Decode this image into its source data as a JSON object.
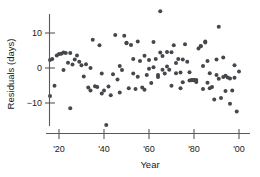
{
  "chart_data": {
    "type": "scatter",
    "title": "",
    "xlabel": "Year",
    "ylabel": "Residuals (days)",
    "xlim": [
      1913,
      2003
    ],
    "ylim": [
      -17,
      17
    ],
    "grid": false,
    "legend": null,
    "x_ticks": [
      {
        "value": 1920,
        "label": "'20"
      },
      {
        "value": 1940,
        "label": "'40"
      },
      {
        "value": 1960,
        "label": "'60"
      },
      {
        "value": 1980,
        "label": "'80"
      },
      {
        "value": 2000,
        "label": "'00"
      }
    ],
    "y_ticks": [
      {
        "value": 10,
        "label": "10"
      },
      {
        "value": 0,
        "label": "0"
      },
      {
        "value": -10,
        "label": "−10"
      }
    ],
    "marker": {
      "shape": "circle",
      "size": 2.0,
      "color": "#44474b"
    },
    "points": [
      {
        "x": 1916,
        "y": 2.3
      },
      {
        "x": 1916,
        "y": -8.0
      },
      {
        "x": 1917,
        "y": 2.6
      },
      {
        "x": 1918,
        "y": -5.1
      },
      {
        "x": 1919,
        "y": 3.6
      },
      {
        "x": 1920,
        "y": 4.0
      },
      {
        "x": 1921,
        "y": 4.1
      },
      {
        "x": 1922,
        "y": 4.4
      },
      {
        "x": 1922,
        "y": -0.6
      },
      {
        "x": 1923,
        "y": 4.3
      },
      {
        "x": 1924,
        "y": 1.5
      },
      {
        "x": 1925,
        "y": 4.3
      },
      {
        "x": 1925,
        "y": -11.5
      },
      {
        "x": 1926,
        "y": 1.0
      },
      {
        "x": 1927,
        "y": 2.4
      },
      {
        "x": 1928,
        "y": 3.6
      },
      {
        "x": 1929,
        "y": 1.8
      },
      {
        "x": 1930,
        "y": 0.8
      },
      {
        "x": 1931,
        "y": -2.4
      },
      {
        "x": 1932,
        "y": 1.1
      },
      {
        "x": 1933,
        "y": -5.6
      },
      {
        "x": 1934,
        "y": -6.4
      },
      {
        "x": 1935,
        "y": 8.1
      },
      {
        "x": 1936,
        "y": -5.2
      },
      {
        "x": 1937,
        "y": -5.4
      },
      {
        "x": 1938,
        "y": 6.5
      },
      {
        "x": 1939,
        "y": -1.6
      },
      {
        "x": 1939,
        "y": -7.3
      },
      {
        "x": 1940,
        "y": -6.4
      },
      {
        "x": 1941,
        "y": -16.3
      },
      {
        "x": 1942,
        "y": -5.3
      },
      {
        "x": 1943,
        "y": -7.8
      },
      {
        "x": 1944,
        "y": -1.8
      },
      {
        "x": 1945,
        "y": 9.4
      },
      {
        "x": 1946,
        "y": -3.3
      },
      {
        "x": 1947,
        "y": 0.6
      },
      {
        "x": 1948,
        "y": -0.6
      },
      {
        "x": 1949,
        "y": 9.2
      },
      {
        "x": 1950,
        "y": 7.2
      },
      {
        "x": 1950,
        "y": 7.1
      },
      {
        "x": 1951,
        "y": -5.8
      },
      {
        "x": 1952,
        "y": 6.6
      },
      {
        "x": 1953,
        "y": -1.6
      },
      {
        "x": 1954,
        "y": -6.0
      },
      {
        "x": 1955,
        "y": 7.6
      },
      {
        "x": 1955,
        "y": -2.5
      },
      {
        "x": 1956,
        "y": 2.0
      },
      {
        "x": 1957,
        "y": -5.6
      },
      {
        "x": 1958,
        "y": -6.2
      },
      {
        "x": 1958,
        "y": 3.5
      },
      {
        "x": 1959,
        "y": -2.0
      },
      {
        "x": 1960,
        "y": 2.3
      },
      {
        "x": 1960,
        "y": -0.2
      },
      {
        "x": 1961,
        "y": -4.3
      },
      {
        "x": 1962,
        "y": 7.4
      },
      {
        "x": 1962,
        "y": 0.2
      },
      {
        "x": 1963,
        "y": 2.6
      },
      {
        "x": 1964,
        "y": -2.6
      },
      {
        "x": 1965,
        "y": 16.2
      },
      {
        "x": 1965,
        "y": 4.4
      },
      {
        "x": 1966,
        "y": -0.5
      },
      {
        "x": 1966,
        "y": 3.4
      },
      {
        "x": 1967,
        "y": -1.6
      },
      {
        "x": 1968,
        "y": 4.6
      },
      {
        "x": 1968,
        "y": 0.4
      },
      {
        "x": 1969,
        "y": -0.5
      },
      {
        "x": 1970,
        "y": 4.5
      },
      {
        "x": 1970,
        "y": -5.1
      },
      {
        "x": 1971,
        "y": 6.5
      },
      {
        "x": 1972,
        "y": 1.4
      },
      {
        "x": 1972,
        "y": -1.5
      },
      {
        "x": 1973,
        "y": 2.6
      },
      {
        "x": 1974,
        "y": -1.3
      },
      {
        "x": 1975,
        "y": 2.4
      },
      {
        "x": 1975,
        "y": -4.1
      },
      {
        "x": 1976,
        "y": 6.8
      },
      {
        "x": 1977,
        "y": 1.8
      },
      {
        "x": 1978,
        "y": -1.2
      },
      {
        "x": 1978,
        "y": -3.6
      },
      {
        "x": 1979,
        "y": -3.5
      },
      {
        "x": 1979,
        "y": -3.4
      },
      {
        "x": 1980,
        "y": -3.4
      },
      {
        "x": 1980,
        "y": -3.5
      },
      {
        "x": 1981,
        "y": -3.4
      },
      {
        "x": 1981,
        "y": -4.0
      },
      {
        "x": 1982,
        "y": 5.6
      },
      {
        "x": 1983,
        "y": 6.3
      },
      {
        "x": 1983,
        "y": 6.2
      },
      {
        "x": 1984,
        "y": 0.6
      },
      {
        "x": 1984,
        "y": -6.0
      },
      {
        "x": 1985,
        "y": 7.6
      },
      {
        "x": 1985,
        "y": 7.3
      },
      {
        "x": 1986,
        "y": 2.0
      },
      {
        "x": 1986,
        "y": -4.2
      },
      {
        "x": 1987,
        "y": -1.5
      },
      {
        "x": 1988,
        "y": -5.4
      },
      {
        "x": 1989,
        "y": -9.0
      },
      {
        "x": 1990,
        "y": 2.4
      },
      {
        "x": 1990,
        "y": -2.0
      },
      {
        "x": 1991,
        "y": 11.8
      },
      {
        "x": 1991,
        "y": -3.1
      },
      {
        "x": 1992,
        "y": -8.6
      },
      {
        "x": 1993,
        "y": 3.0
      },
      {
        "x": 1993,
        "y": -2.6
      },
      {
        "x": 1994,
        "y": -2.2
      },
      {
        "x": 1994,
        "y": -6.6
      },
      {
        "x": 1995,
        "y": -2.7
      },
      {
        "x": 1996,
        "y": -10.2
      },
      {
        "x": 1996,
        "y": -3.0
      },
      {
        "x": 1997,
        "y": -6.4
      },
      {
        "x": 1998,
        "y": -2.8
      },
      {
        "x": 1998,
        "y": 0.8
      },
      {
        "x": 1999,
        "y": -12.4
      },
      {
        "x": 2000,
        "y": -1.0
      },
      {
        "x": 1934,
        "y": 0.0
      },
      {
        "x": 1947,
        "y": -7.0
      },
      {
        "x": 1953,
        "y": 2.6
      },
      {
        "x": 1964,
        "y": -2.0
      },
      {
        "x": 1974,
        "y": -5.8
      },
      {
        "x": 1987,
        "y": -5.8
      }
    ]
  }
}
